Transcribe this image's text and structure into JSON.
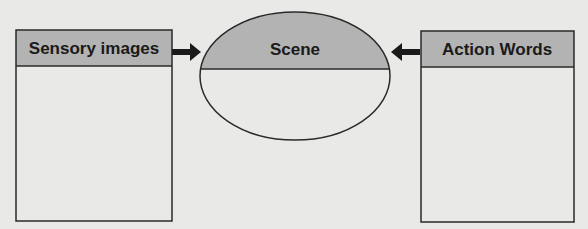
{
  "diagram": {
    "left_box": {
      "title": "Sensory images"
    },
    "center": {
      "title": "Scene"
    },
    "right_box": {
      "title": "Action Words"
    },
    "arrows": [
      {
        "from": "Sensory images",
        "to": "Scene"
      },
      {
        "from": "Action Words",
        "to": "Scene"
      }
    ],
    "colors": {
      "background": "#e9e9e7",
      "header_fill": "#b3b3b3",
      "stroke": "#2a2a2a"
    }
  }
}
